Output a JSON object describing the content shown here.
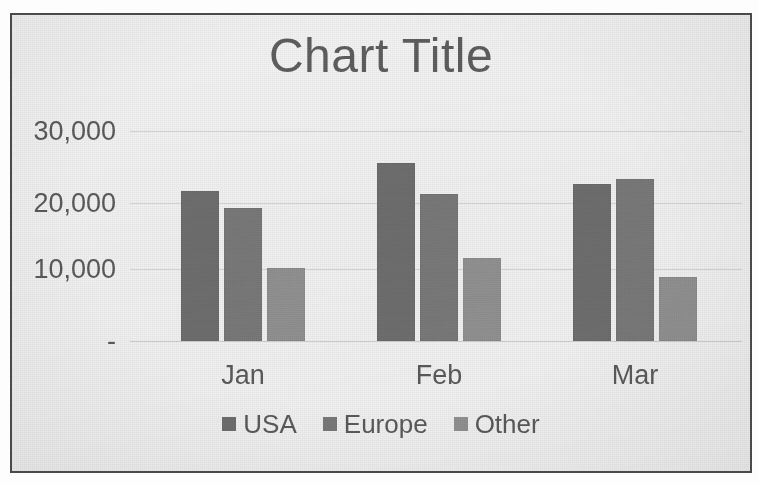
{
  "chart_data": {
    "type": "bar",
    "title": "Chart Title",
    "xlabel": "",
    "ylabel": "",
    "categories": [
      "Jan",
      "Feb",
      "Mar"
    ],
    "series": [
      {
        "name": "USA",
        "color": "#6f6f6f",
        "values": [
          21500,
          25400,
          22500
        ]
      },
      {
        "name": "Europe",
        "color": "#7a7a7a",
        "values": [
          19000,
          21000,
          23200
        ]
      },
      {
        "name": "Other",
        "color": "#929292",
        "values": [
          10500,
          11800,
          9200
        ]
      }
    ],
    "ylim": [
      0,
      30000
    ],
    "yticks": [
      0,
      10000,
      20000,
      30000
    ],
    "ytick_labels": [
      "-",
      "10,000",
      "20,000",
      "30,000"
    ],
    "grid": true,
    "legend_position": "bottom"
  },
  "legend": {
    "items": [
      {
        "label": "USA",
        "color": "#6f6f6f"
      },
      {
        "label": "Europe",
        "color": "#7a7a7a"
      },
      {
        "label": "Other",
        "color": "#929292"
      }
    ]
  },
  "axis": {
    "y_labels": [
      "30,000",
      "20,000",
      "10,000",
      "-"
    ],
    "x_labels": [
      "Jan",
      "Feb",
      "Mar"
    ]
  },
  "style": {
    "frame_border_color": "#4a4a4a",
    "plot_background": "#f3f3f3",
    "gridline_color": "#d6d6d6",
    "text_color": "#5b5b5b",
    "title_color": "#5e5e5e"
  }
}
